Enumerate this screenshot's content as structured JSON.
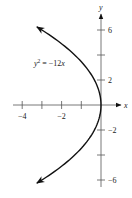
{
  "chart_data": {
    "type": "line",
    "title": "",
    "xlabel": "x",
    "ylabel": "y",
    "xlim": [
      -4.5,
      1
    ],
    "ylim": [
      -6.5,
      7
    ],
    "grid": false,
    "x_ticks": [
      -4,
      -3,
      -2,
      -1
    ],
    "x_tick_labels": [
      {
        "value": -4,
        "text": "−4"
      },
      {
        "value": -2,
        "text": "−2"
      }
    ],
    "y_ticks": [
      -6,
      -4,
      -2,
      2,
      4,
      6
    ],
    "y_tick_labels": [
      {
        "value": 6,
        "text": "6"
      },
      {
        "value": 2,
        "text": "2"
      },
      {
        "value": -2,
        "text": "−2"
      },
      {
        "value": -6,
        "text": "−6"
      }
    ],
    "series": [
      {
        "name": "parabola",
        "equation": "y^2 = -12x",
        "label": "y² = −12x",
        "y_range": [
          -6.25,
          6.25
        ],
        "arrows": "both-ends",
        "color": "#111111"
      }
    ]
  }
}
